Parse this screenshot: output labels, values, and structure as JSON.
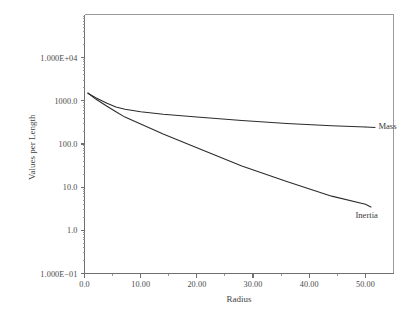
{
  "chart_data": {
    "type": "line",
    "title": "",
    "xlabel": "Radius",
    "ylabel": "Values per Length",
    "xlim": [
      0.0,
      55.0
    ],
    "ylim": [
      0.1,
      100000.0
    ],
    "yscale": "log",
    "xscale": "linear",
    "grid": false,
    "legend_position": "inline-right-annotations",
    "xticks": [
      0.0,
      10.0,
      20.0,
      30.0,
      40.0,
      50.0
    ],
    "xtick_labels": [
      "0.0",
      "10.00",
      "20.00",
      "30.00",
      "40.00",
      "50.00"
    ],
    "yticks": [
      0.1,
      1.0,
      10.0,
      100.0,
      1000.0,
      10000.0
    ],
    "ytick_labels": [
      "1.000E-01",
      "1.0",
      "10.0",
      "100.0",
      "1000.0",
      "1.000E+04"
    ],
    "series": [
      {
        "name": "Mass",
        "annotation": "Mass",
        "x": [
          0.6,
          2.0,
          4.0,
          5.6,
          7.2,
          10.0,
          14.0,
          20.0,
          28.0,
          36.0,
          44.0,
          50.0
        ],
        "y": [
          1500,
          1180,
          880,
          720,
          640,
          560,
          490,
          420,
          350,
          300,
          265,
          248
        ]
      },
      {
        "name": "Inertia",
        "annotation": "Inertia",
        "x": [
          0.6,
          2.0,
          4.0,
          5.6,
          7.2,
          10.0,
          14.0,
          20.0,
          28.0,
          36.0,
          44.0,
          50.0
        ],
        "y": [
          1520,
          1100,
          750,
          560,
          420,
          290,
          170,
          82,
          31,
          13.5,
          6.2,
          4.0
        ]
      }
    ],
    "colors": {
      "background": "#ffffff",
      "line": "#2b2b2b",
      "axis": "#6f6f6f",
      "frame": "#9a9a9a",
      "text": "#3f3f3f"
    }
  },
  "annotations": {
    "mass_label": "Mass",
    "inertia_label": "Inertia"
  }
}
